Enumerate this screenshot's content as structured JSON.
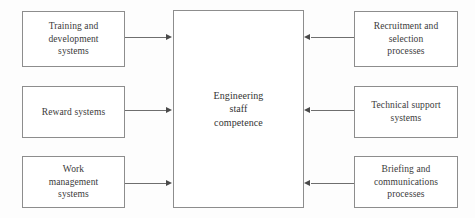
{
  "diagram": {
    "title": "Engineering staff competence",
    "type": "influence-diagram",
    "center": {
      "label": "Engineering\nstaff\ncompetence"
    },
    "left_nodes": [
      {
        "label": "Training and\ndevelopment\nsystems"
      },
      {
        "label": "Reward systems"
      },
      {
        "label": "Work\nmanagement\nsystems"
      }
    ],
    "right_nodes": [
      {
        "label": "Recruitment and\nselection\nprocesses"
      },
      {
        "label": "Technical support\nsystems"
      },
      {
        "label": "Briefing and\ncommunications\nprocesses"
      }
    ],
    "connectors": [
      {
        "from": "Training and development systems",
        "to": "Engineering staff competence",
        "direction": "right"
      },
      {
        "from": "Reward systems",
        "to": "Engineering staff competence",
        "direction": "right"
      },
      {
        "from": "Work management systems",
        "to": "Engineering staff competence",
        "direction": "right"
      },
      {
        "from": "Recruitment and selection processes",
        "to": "Engineering staff competence",
        "direction": "left"
      },
      {
        "from": "Technical support systems",
        "to": "Engineering staff competence",
        "direction": "left"
      },
      {
        "from": "Briefing and communications processes",
        "to": "Engineering staff competence",
        "direction": "left"
      }
    ],
    "colors": {
      "background": "#fdfdfd",
      "box_border": "#8d8d8d",
      "box_fill": "#ffffff",
      "text": "#3a3a3a",
      "connector": "#6e6e6e",
      "arrowhead": "#4a4a4a"
    }
  }
}
